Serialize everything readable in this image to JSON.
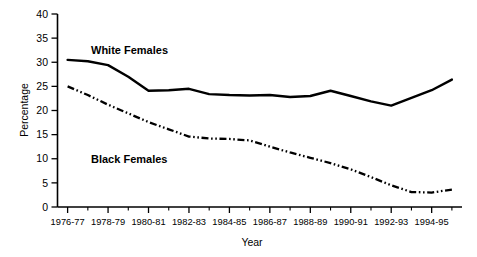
{
  "chart_data": {
    "type": "line",
    "title": "",
    "xlabel": "Year",
    "ylabel": "Percentage",
    "ylim": [
      0,
      40
    ],
    "ytick_step": 5,
    "yticks": [
      0,
      5,
      10,
      15,
      20,
      25,
      30,
      35,
      40
    ],
    "grid": false,
    "legend_position": "inline-annotation",
    "x": [
      "1976-77",
      "1977-78",
      "1978-79",
      "1979-80",
      "1980-81",
      "1981-82",
      "1982-83",
      "1983-84",
      "1984-85",
      "1985-86",
      "1986-87",
      "1987-88",
      "1988-89",
      "1989-90",
      "1990-91",
      "1991-92",
      "1992-93",
      "1993-94",
      "1994-95",
      "1995-96"
    ],
    "xtick_labels_shown": [
      "1976-77",
      "1978-79",
      "1980-81",
      "1982-83",
      "1984-85",
      "1986-87",
      "1988-89",
      "1990-91",
      "1992-93",
      "1994-95"
    ],
    "series": [
      {
        "name": "White Females",
        "style": "solid",
        "color": "#000000",
        "values": [
          30.5,
          30.2,
          29.4,
          27.0,
          24.1,
          24.2,
          24.5,
          23.4,
          23.2,
          23.1,
          23.2,
          22.8,
          23.0,
          24.1,
          23.0,
          21.9,
          21.0,
          22.6,
          24.2,
          26.4
        ]
      },
      {
        "name": "Black Females",
        "style": "dash-dot-dot",
        "color": "#000000",
        "values": [
          25.0,
          23.2,
          21.2,
          19.4,
          17.6,
          16.1,
          14.6,
          14.2,
          14.1,
          13.8,
          12.5,
          11.3,
          10.2,
          9.1,
          7.8,
          6.2,
          4.5,
          3.1,
          3.0,
          3.6
        ]
      }
    ],
    "annotations": [
      {
        "text": "White Females",
        "series": "White Females"
      },
      {
        "text": "Black Females",
        "series": "Black Females"
      }
    ]
  },
  "axes": {
    "y_title": "Percentage",
    "x_title": "Year",
    "y_tick_labels": [
      "40",
      "35",
      "30",
      "25",
      "20",
      "15",
      "10",
      "5",
      "0"
    ],
    "x_tick_labels": [
      "1976-77",
      "1978-79",
      "1980-81",
      "1982-83",
      "1984-85",
      "1986-87",
      "1988-89",
      "1990-91",
      "1992-93",
      "1994-95"
    ]
  },
  "labels": {
    "white_females": "White Females",
    "black_females": "Black Females"
  }
}
